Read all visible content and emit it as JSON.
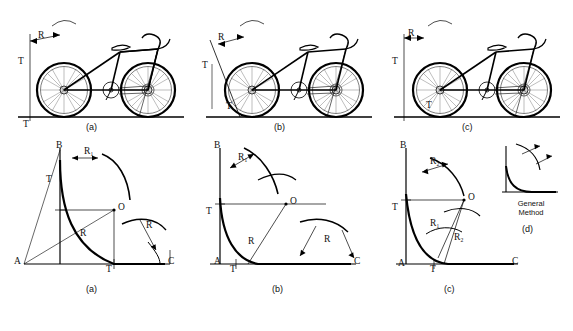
{
  "figure": {
    "title_hidden": "",
    "top_row": {
      "panels": [
        {
          "id": "top-a",
          "caption": "(a)",
          "labels": [
            "R",
            "T",
            "T"
          ]
        },
        {
          "id": "top-b",
          "caption": "(b)",
          "labels": [
            "R",
            "T",
            "T"
          ]
        },
        {
          "id": "top-c",
          "caption": "(c)",
          "labels": [
            "R",
            "T",
            "T"
          ]
        }
      ]
    },
    "bottom_row": {
      "panels": [
        {
          "id": "bot-a",
          "caption": "(a)",
          "labels": [
            "B",
            "R₁",
            "T",
            "O",
            "R",
            "R",
            "A",
            "T",
            "C"
          ]
        },
        {
          "id": "bot-b",
          "caption": "(b)",
          "labels": [
            "B",
            "R₁",
            "O",
            "T",
            "R",
            "R",
            "A",
            "T",
            "C"
          ]
        },
        {
          "id": "bot-c",
          "caption": "(c)",
          "labels": [
            "B",
            "R₂",
            "O",
            "T",
            "R₁",
            "R₂",
            "A",
            "T",
            "C"
          ]
        },
        {
          "id": "bot-d",
          "caption": "(d)",
          "title": "General\nMethod",
          "title_line1": "General",
          "title_line2": "Method"
        }
      ]
    },
    "letters": {
      "B": "B",
      "A": "A",
      "C": "C",
      "O": "O",
      "T": "T",
      "R": "R",
      "R1": "R₁",
      "R2": "R₂",
      "cap_a": "(a)",
      "cap_b": "(b)",
      "cap_c": "(c)",
      "cap_d": "(d)",
      "general": "General",
      "method": "Method"
    },
    "colors": {
      "ink": "#111111",
      "line": "#000000",
      "background": "#ffffff",
      "thin": "#333333"
    }
  }
}
